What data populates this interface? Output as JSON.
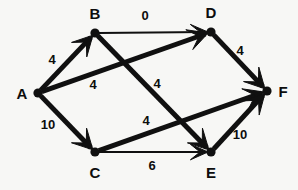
{
  "figure": {
    "name": "directed-weighted-graph",
    "background_color": "#f7f7f5",
    "ink_color": "#101010",
    "width": 298,
    "height": 190
  },
  "graph": {
    "type": "directed-weighted-graph",
    "nodes": [
      {
        "id": "A",
        "label": "A",
        "x": 38,
        "y": 93,
        "label_x": 22,
        "label_y": 95
      },
      {
        "id": "B",
        "label": "B",
        "x": 95,
        "y": 33,
        "label_x": 95,
        "label_y": 15
      },
      {
        "id": "C",
        "label": "C",
        "x": 95,
        "y": 152,
        "label_x": 95,
        "label_y": 174
      },
      {
        "id": "D",
        "label": "D",
        "x": 211,
        "y": 32,
        "label_x": 211,
        "label_y": 14
      },
      {
        "id": "E",
        "label": "E",
        "x": 211,
        "y": 152,
        "label_x": 211,
        "label_y": 174
      },
      {
        "id": "F",
        "label": "F",
        "x": 267,
        "y": 91,
        "label_x": 283,
        "label_y": 93
      }
    ],
    "edges": [
      {
        "id": "A-B",
        "from": "A",
        "to": "B",
        "weight": "4",
        "label_x": 52,
        "label_y": 61,
        "thickness": 5
      },
      {
        "id": "A-C",
        "from": "A",
        "to": "C",
        "weight": "10",
        "label_x": 48,
        "label_y": 126,
        "thickness": 5
      },
      {
        "id": "A-D",
        "from": "A",
        "to": "D",
        "weight": "4",
        "label_x": 93,
        "label_y": 86,
        "thickness": 5
      },
      {
        "id": "B-D",
        "from": "B",
        "to": "D",
        "weight": "0",
        "label_x": 145,
        "label_y": 17,
        "thickness": 2
      },
      {
        "id": "B-E",
        "from": "B",
        "to": "E",
        "weight": "4",
        "label_x": 157,
        "label_y": 85,
        "thickness": 5
      },
      {
        "id": "C-E",
        "from": "C",
        "to": "E",
        "weight": "6",
        "label_x": 152,
        "label_y": 167,
        "thickness": 2
      },
      {
        "id": "C-F",
        "from": "C",
        "to": "F",
        "weight": "4",
        "label_x": 146,
        "label_y": 122,
        "thickness": 5
      },
      {
        "id": "D-F",
        "from": "D",
        "to": "F",
        "weight": "4",
        "label_x": 240,
        "label_y": 52,
        "thickness": 5
      },
      {
        "id": "E-F",
        "from": "E",
        "to": "F",
        "weight": "10",
        "label_x": 240,
        "label_y": 136,
        "thickness": 5
      }
    ]
  }
}
